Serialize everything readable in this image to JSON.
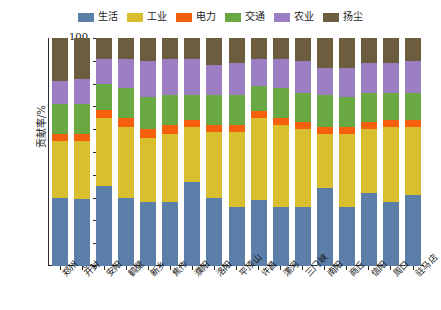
{
  "chart_data": {
    "type": "bar",
    "stacked": true,
    "title": "",
    "xlabel": "",
    "ylabel": "贡献率/%",
    "ylim": [
      0,
      100
    ],
    "yticks": [
      0,
      10,
      20,
      30,
      40,
      50,
      60,
      70,
      80,
      90,
      100
    ],
    "grid": false,
    "legend_position": "top-center",
    "categories": [
      "郑州",
      "开封",
      "安阳",
      "鹤壁",
      "新乡",
      "焦作",
      "濮阳",
      "洛阳",
      "平顶山",
      "许昌",
      "漯河",
      "三门峡",
      "南阳",
      "商丘",
      "信阳",
      "周口",
      "驻马店"
    ],
    "series": [
      {
        "name": "生活",
        "color": "#5B7FA8",
        "values": [
          30,
          29.5,
          35,
          30,
          28,
          28,
          37,
          30,
          26,
          29,
          26,
          26,
          34,
          26,
          32,
          28,
          31
        ]
      },
      {
        "name": "工业",
        "color": "#D9BE2E",
        "values": [
          25,
          25.5,
          30,
          31,
          28,
          30,
          24,
          29,
          33,
          36,
          36,
          34,
          24,
          32,
          28,
          33,
          30
        ]
      },
      {
        "name": "电力",
        "color": "#F4600E",
        "values": [
          3,
          3,
          3.5,
          4,
          4,
          4,
          3,
          3,
          3,
          3,
          3,
          3,
          3,
          3,
          3,
          3,
          3
        ]
      },
      {
        "name": "交通",
        "color": "#6AA844",
        "values": [
          13,
          13,
          11.5,
          13,
          14,
          13,
          11,
          13,
          13,
          11,
          13,
          13,
          14,
          13,
          13,
          12,
          12
        ]
      },
      {
        "name": "农业",
        "color": "#9B7FC2",
        "values": [
          10,
          11,
          11,
          13,
          16,
          16,
          16,
          13,
          14,
          12,
          13,
          14,
          12,
          13,
          13,
          13,
          14
        ]
      },
      {
        "name": "扬尘",
        "color": "#6B5D3E",
        "values": [
          19,
          18,
          9,
          9,
          10,
          9,
          9,
          12,
          11,
          9,
          9,
          10,
          13,
          13,
          11,
          11,
          10
        ]
      }
    ]
  },
  "legend": {
    "items": [
      {
        "label": "生活",
        "swatch_name": "legend-swatch-shenghuo"
      },
      {
        "label": "工业",
        "swatch_name": "legend-swatch-gongye"
      },
      {
        "label": "电力",
        "swatch_name": "legend-swatch-dianli"
      },
      {
        "label": "交通",
        "swatch_name": "legend-swatch-jiaotong"
      },
      {
        "label": "农业",
        "swatch_name": "legend-swatch-nongye"
      },
      {
        "label": "扬尘",
        "swatch_name": "legend-swatch-yangchen"
      }
    ]
  },
  "axes": {
    "y_title": "贡献率/%",
    "y_tick_labels": [
      "0",
      "10",
      "20",
      "30",
      "40",
      "50",
      "60",
      "70",
      "80",
      "90",
      "100"
    ]
  }
}
